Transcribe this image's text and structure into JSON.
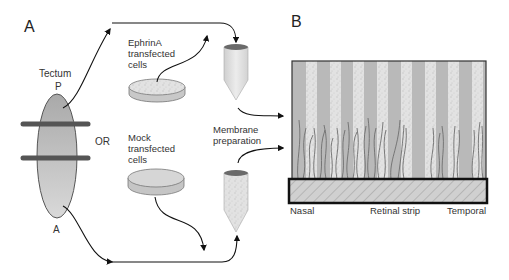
{
  "panels": {
    "a": {
      "letter": "A"
    },
    "b": {
      "letter": "B"
    }
  },
  "tectum": {
    "title": "Tectum",
    "posterior_label": "P",
    "anterior_label": "A",
    "or_label": "OR"
  },
  "dishes": {
    "ephrin": {
      "line1": "EphrinA",
      "line2": "transfected",
      "line3": "cells"
    },
    "mock": {
      "line1": "Mock",
      "line2": "transfected",
      "line3": "cells"
    }
  },
  "membrane": {
    "line1": "Membrane",
    "line2": "preparation"
  },
  "retina": {
    "nasal_label": "Nasal",
    "strip_label": "Retinal strip",
    "temporal_label": "Temporal"
  },
  "colors": {
    "stripe_dark": "#b8b8b8",
    "stripe_light": "#dedede",
    "axon": "#6e6e6e",
    "tectum_fill": "#bdbdbd",
    "band": "#555555"
  }
}
